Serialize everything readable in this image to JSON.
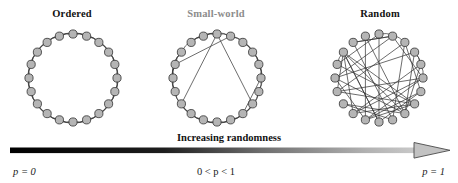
{
  "figure": {
    "title_labels": {
      "ordered": "Ordered",
      "small_world": "Small-world",
      "random": "Random"
    },
    "axis_caption": "Increasing randomness",
    "parameter_labels": {
      "left": "p = 0",
      "middle": "0 < p < 1",
      "right": "p = 1"
    },
    "colors": {
      "node_fill": "#b5b5b5",
      "node_stroke": "#3a3a3a",
      "edge": "#333333",
      "label_dark": "#121212",
      "label_gray": "#8c8c8c",
      "arrow_start": "#000000",
      "arrow_end": "#c9c9c9",
      "background": "#ffffff"
    }
  },
  "chart_data": {
    "type": "diagram",
    "xlabel": "Increasing randomness",
    "ylabel": "",
    "panels": [
      {
        "name": "ordered",
        "label": "Ordered",
        "p": "p = 0",
        "nodes": 20,
        "neighbors_k": 4,
        "rewired_edges": 0,
        "description": "Regular ring lattice: each node joined to its 2 nearest neighbours on each side."
      },
      {
        "name": "small-world",
        "label": "Small-world",
        "p": "0 < p < 1",
        "nodes": 20,
        "neighbors_k": 4,
        "rewired_edges": 5,
        "description": "Ring lattice with a few long-range shortcuts created by random rewiring."
      },
      {
        "name": "random",
        "label": "Random",
        "p": "p = 1",
        "nodes": 20,
        "neighbors_k": 4,
        "rewired_edges": 40,
        "description": "All edges rewired at random; chords cross the interior of the circle."
      }
    ],
    "legend_position": "none",
    "grid": false
  }
}
